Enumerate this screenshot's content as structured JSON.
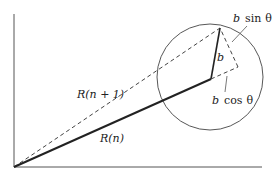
{
  "diagram": {
    "labels": {
      "r_n": "R(n)",
      "r_n1": "R(n + 1)",
      "b": "b",
      "b_sin_var": "b",
      "b_sin_fn": "sin",
      "b_sin_theta": "θ",
      "b_cos_var": "b",
      "b_cos_fn": "cos",
      "b_cos_theta": "θ"
    },
    "colors": {
      "stroke": "#333333",
      "background": "#ffffff"
    }
  }
}
